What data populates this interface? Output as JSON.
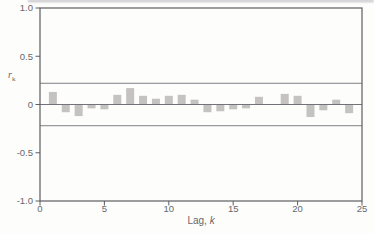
{
  "figure": {
    "background": "#fdfdfc",
    "colors": {
      "frame": "#5d5e62",
      "zero_line": "#727378",
      "confidence_line": "#7e7f84",
      "bar": "#c4c3c1",
      "text": "#66676b"
    }
  },
  "chart_data": {
    "type": "bar",
    "title": "",
    "xlabel_text": "Lag, ",
    "xlabel_var": "k",
    "ylabel_var": "r",
    "ylabel_sub": "k",
    "x": [
      1,
      2,
      3,
      4,
      5,
      6,
      7,
      8,
      9,
      10,
      11,
      12,
      13,
      14,
      15,
      16,
      17,
      18,
      19,
      20,
      21,
      22,
      23,
      24
    ],
    "values": [
      0.13,
      -0.08,
      -0.12,
      -0.04,
      -0.05,
      0.1,
      0.17,
      0.09,
      0.06,
      0.09,
      0.1,
      0.05,
      -0.08,
      -0.07,
      -0.05,
      -0.04,
      0.08,
      0.0,
      0.11,
      0.09,
      -0.13,
      -0.06,
      0.05,
      -0.09
    ],
    "xlim": [
      0,
      25
    ],
    "ylim": [
      -1.0,
      1.0
    ],
    "x_ticks": [
      0,
      5,
      10,
      15,
      20,
      25
    ],
    "y_tick_values": [
      1.0,
      0.5,
      0,
      -0.5,
      -1.0
    ],
    "y_tick_labels": [
      "1.0",
      "0.5",
      "0",
      "-0.5",
      "-1.0"
    ],
    "confidence_bounds": [
      0.22,
      -0.22
    ],
    "zero_line": 0,
    "grid": false,
    "legend": false,
    "bar_width_px": 8
  }
}
